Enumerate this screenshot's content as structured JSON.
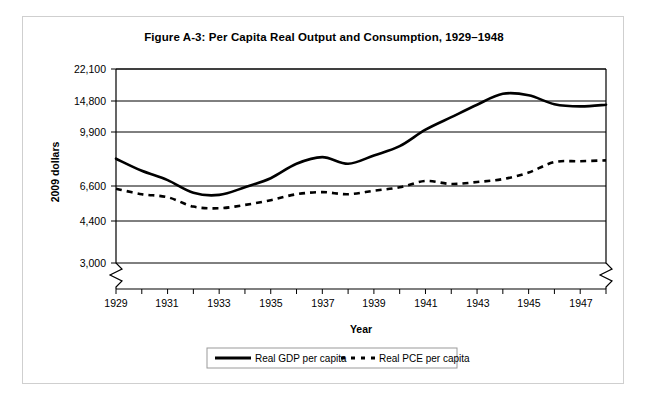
{
  "figure": {
    "title": "Figure A-3: Per Capita Real Output and Consumption, 1929–1948",
    "xlabel": "Year",
    "ylabel": "2009 dollars"
  },
  "legend": {
    "items": [
      {
        "label": "Real GDP per capita",
        "style": "solid"
      },
      {
        "label": "Real PCE per capita",
        "style": "dashed"
      }
    ]
  },
  "yticks": [
    "3,000",
    "4,400",
    "6,600",
    "9,900",
    "14,800",
    "22,100"
  ],
  "xticks": [
    "1929",
    "1931",
    "1933",
    "1935",
    "1937",
    "1939",
    "1941",
    "1943",
    "1945",
    "1947"
  ],
  "chart_data": {
    "type": "line",
    "title": "Figure A-3: Per Capita Real Output and Consumption, 1929–1948",
    "xlabel": "Year",
    "ylabel": "2009 dollars",
    "yscale": "log",
    "ylim": [
      3000,
      22100
    ],
    "ytick_values": [
      3000,
      4400,
      6600,
      9900,
      14800,
      22100
    ],
    "ytick_labels": [
      "3,000",
      "4,400",
      "6,600",
      "9,900",
      "14,800",
      "22,100"
    ],
    "xlim": [
      1929,
      1948
    ],
    "xtick_labels": [
      "1929",
      "1931",
      "1933",
      "1935",
      "1937",
      "1939",
      "1941",
      "1943",
      "1945",
      "1947"
    ],
    "grid": true,
    "axis_break": "both ends of horizontal axis and below 3,000 on vertical axis",
    "legend_position": "bottom-center",
    "x": [
      1929,
      1930,
      1931,
      1932,
      1933,
      1934,
      1935,
      1936,
      1937,
      1938,
      1939,
      1940,
      1941,
      1942,
      1943,
      1944,
      1945,
      1946,
      1947,
      1948
    ],
    "series": [
      {
        "name": "Real GDP per capita",
        "style": "solid",
        "values": [
          8100,
          7400,
          6900,
          6100,
          5950,
          6500,
          7000,
          7800,
          8200,
          7800,
          8300,
          8900,
          10200,
          12000,
          14100,
          16200,
          15900,
          14200,
          13800,
          14100
        ]
      },
      {
        "name": "Real PCE per capita",
        "style": "dashed",
        "values": [
          6400,
          6000,
          5800,
          5200,
          5100,
          5300,
          5600,
          6000,
          6150,
          6000,
          6250,
          6500,
          6850,
          6700,
          6800,
          6950,
          7300,
          7900,
          7950,
          8000
        ]
      }
    ]
  }
}
